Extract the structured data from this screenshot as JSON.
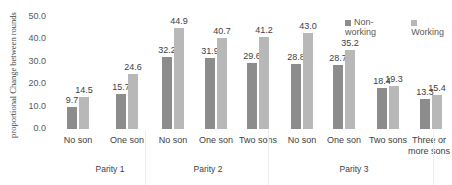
{
  "chart_data": {
    "type": "bar",
    "title": "",
    "ylabel": "proportional Change between rounds",
    "xlabel": "",
    "ylim": [
      0,
      50
    ],
    "yticks": [
      "50.0",
      "40.0",
      "30.0",
      "20.0",
      "10.0",
      "0.0"
    ],
    "grid": false,
    "legend_position": "top-right",
    "groups": [
      {
        "label": "Parity 1",
        "categories": [
          "No son",
          "One son"
        ]
      },
      {
        "label": "Parity 2",
        "categories": [
          "No son",
          "One son",
          "Two sons"
        ]
      },
      {
        "label": "Parity 3",
        "categories": [
          "No son",
          "One son",
          "Two sons",
          "Three or more sons"
        ]
      }
    ],
    "categories": [
      "No son",
      "One son",
      "No son",
      "One son",
      "Two sons",
      "No son",
      "One son",
      "Two sons",
      "Three or more sons"
    ],
    "series": [
      {
        "name": "Non-working",
        "color": "#8c8c8c",
        "values": [
          9.7,
          15.7,
          32.2,
          31.9,
          29.6,
          28.8,
          28.7,
          18.4,
          13.3
        ]
      },
      {
        "name": "Working",
        "color": "#b8b8b8",
        "values": [
          14.5,
          24.6,
          44.9,
          40.7,
          41.2,
          43.0,
          35.2,
          19.3,
          15.4
        ]
      }
    ],
    "value_labels": {
      "Non-working": [
        "9.7",
        "15.7",
        "32.2",
        "31.9",
        "29.6",
        "28.8",
        "28.7",
        "18.4",
        "13.3"
      ],
      "Working": [
        "14.5",
        "24.6",
        "44.9",
        "40.7",
        "41.2",
        "43.0",
        "35.2",
        "19.3",
        "15.4"
      ]
    }
  },
  "labels": {
    "ylabel": "proportional Change between rounds",
    "legend_nonworking": "Non-working",
    "legend_working": "Working",
    "cat_0": "No son",
    "cat_1": "One son",
    "cat_2": "No son",
    "cat_3": "One son",
    "cat_4": "Two sons",
    "cat_5": "No son",
    "cat_6": "One son",
    "cat_7": "Two sons",
    "cat_8a": "Three or",
    "cat_8b": "more sons",
    "grp_0": "Parity 1",
    "grp_1": "Parity 2",
    "grp_2": "Parity 3"
  }
}
